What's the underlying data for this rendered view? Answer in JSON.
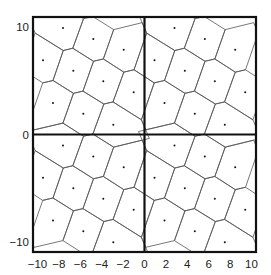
{
  "chart_data": {
    "type": "scatter",
    "title": "",
    "xlabel": "",
    "ylabel": "",
    "xlim": [
      -10.4,
      10.4
    ],
    "ylim": [
      -10.9,
      10.9
    ],
    "grid": false,
    "legend": null,
    "x_ticks": [
      -10,
      -8,
      -6,
      -4,
      -2,
      0,
      2,
      4,
      6,
      8,
      10
    ],
    "x_tick_labels": [
      "−10",
      "−8",
      "−6",
      "−4",
      "−2",
      "0",
      "2",
      "4",
      "6",
      "8",
      "10"
    ],
    "y_ticks": [
      10,
      0,
      -10
    ],
    "y_tick_labels": [
      "10",
      "0",
      "−10"
    ],
    "tile_copies": [
      [
        0,
        0
      ],
      [
        1,
        0
      ],
      [
        0,
        1
      ],
      [
        1,
        1
      ]
    ],
    "tile_points_top_left_quadrant": [
      {
        "x": -7.57,
        "y": 10.05
      },
      {
        "x": -4.74,
        "y": 9.01
      },
      {
        "x": -1.9,
        "y": 8.01
      },
      {
        "x": -9.44,
        "y": 7.01
      },
      {
        "x": -6.61,
        "y": 6.04
      },
      {
        "x": -3.8,
        "y": 5.04
      },
      {
        "x": -0.96,
        "y": 4.01
      },
      {
        "x": -8.5,
        "y": 3.0
      },
      {
        "x": -5.67,
        "y": 2.0
      },
      {
        "x": -2.87,
        "y": 0.97
      }
    ],
    "tile_points_px": [
      [
        30,
        11
      ],
      [
        60.3,
        22
      ],
      [
        90.7,
        32.7
      ],
      [
        10,
        43.3
      ],
      [
        40.3,
        53.7
      ],
      [
        70.3,
        64.3
      ],
      [
        100.7,
        75.3
      ],
      [
        20,
        86
      ],
      [
        50.3,
        96.7
      ],
      [
        80.3,
        107.7
      ]
    ],
    "tile_size_px": [
      111.5,
      117.5
    ],
    "frame_px": {
      "left": 33,
      "top": 17,
      "right": 256,
      "bottom": 252
    },
    "axis_zero_px": {
      "x": 144.5,
      "y": 134.5
    },
    "colors": {
      "edges": "#555555",
      "frame": "#111111",
      "points": "#111111",
      "background": "#ffffff"
    }
  }
}
